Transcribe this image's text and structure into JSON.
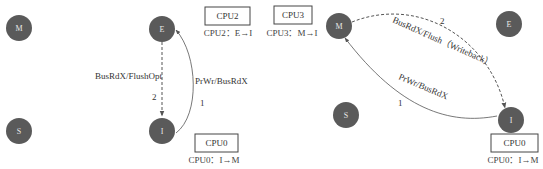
{
  "colors": {
    "state_fill": "#5a5a5a",
    "state_text": "#e8e8e8",
    "line": "#555555",
    "text": "#333333"
  },
  "left_panel": {
    "states": [
      {
        "id": "M",
        "label": "M"
      },
      {
        "id": "E",
        "label": "E"
      },
      {
        "id": "S",
        "label": "S"
      },
      {
        "id": "I",
        "label": "I"
      }
    ],
    "transitions": [
      {
        "from": "E",
        "to": "I",
        "style": "dashed",
        "label": "BusRdX/FlushOpt",
        "order": "2"
      },
      {
        "from": "I",
        "to": "E",
        "style": "solid",
        "label": "PrWr/BusRdX",
        "order": "1"
      }
    ],
    "cpu_boxes": [
      {
        "name": "CPU2",
        "caption": "CPU2：E→I"
      },
      {
        "name": "CPU0",
        "caption": "CPU0：I→M"
      }
    ]
  },
  "right_panel": {
    "states": [
      {
        "id": "M",
        "label": "M"
      },
      {
        "id": "E",
        "label": "E"
      },
      {
        "id": "S",
        "label": "S"
      },
      {
        "id": "I",
        "label": "I"
      }
    ],
    "transitions": [
      {
        "from": "M",
        "to": "I",
        "style": "dashed",
        "label": "BusRdX/Flush（Writeback）",
        "order": "2"
      },
      {
        "from": "I",
        "to": "M",
        "style": "solid",
        "label": "PrWr/BusRdX",
        "order": "1"
      }
    ],
    "cpu_boxes": [
      {
        "name": "CPU3",
        "caption": "CPU3：M→I"
      },
      {
        "name": "CPU0",
        "caption": "CPU0：I→M"
      }
    ]
  }
}
